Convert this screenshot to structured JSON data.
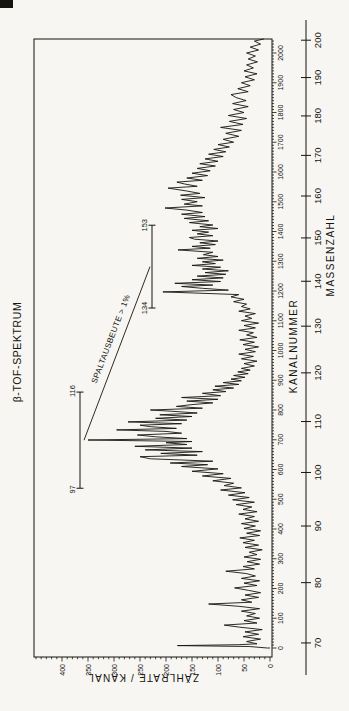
{
  "page": {
    "background": "#f7f6f2",
    "ink_color": "#15140f",
    "scan_artifact": "black mark top-left corner"
  },
  "chart_data": {
    "type": "line",
    "title": "β-TOF-SPEKTRUM",
    "xlabel": "KANALNUMMER",
    "x2label": "MASSENZAHL",
    "ylabel": "ZÄHLRATE / KANAL",
    "orientation": "chart rotated 90deg counterclockwise on page",
    "channel_axis": {
      "min": 0,
      "max": 2047,
      "label_step": 100,
      "minor_step": 10,
      "labels": [
        0,
        100,
        200,
        300,
        400,
        500,
        600,
        700,
        800,
        900,
        1000,
        1100,
        1200,
        1300,
        1400,
        1500,
        1600,
        1700,
        1800,
        1900,
        2000
      ]
    },
    "count_axis": {
      "min": 0,
      "max": 455,
      "label_step": 50,
      "minor_step": 10,
      "labels": [
        0,
        50,
        100,
        150,
        200,
        250,
        300,
        350,
        400
      ]
    },
    "mass_axis": {
      "min": 70,
      "max": 200,
      "tick_step": 10,
      "labels": [
        70,
        80,
        90,
        100,
        110,
        120,
        130,
        140,
        150,
        160,
        170,
        180,
        190,
        200
      ],
      "calibration_channel_from_mass": {
        "a": 350.8,
        "b": -2918
      }
    },
    "annotations": {
      "yield_label": "SPALTAUSBEUTE > 1%",
      "brackets": [
        {
          "mass_from": 97,
          "mass_to": 116,
          "label_low": "97",
          "label_high": "116"
        },
        {
          "mass_from": 134,
          "mass_to": 153,
          "label_low": "134",
          "label_high": "153"
        }
      ]
    },
    "series": [
      {
        "name": "beta-tof-spectrum",
        "points": [
          [
            0,
            5
          ],
          [
            5,
            40
          ],
          [
            8,
            178
          ],
          [
            11,
            60
          ],
          [
            14,
            25
          ],
          [
            22,
            45
          ],
          [
            30,
            18
          ],
          [
            38,
            52
          ],
          [
            46,
            22
          ],
          [
            54,
            48
          ],
          [
            62,
            15
          ],
          [
            70,
            58
          ],
          [
            77,
            88
          ],
          [
            84,
            25
          ],
          [
            92,
            50
          ],
          [
            100,
            20
          ],
          [
            108,
            45
          ],
          [
            116,
            28
          ],
          [
            124,
            55
          ],
          [
            132,
            20
          ],
          [
            140,
            60
          ],
          [
            148,
            118
          ],
          [
            154,
            35
          ],
          [
            162,
            55
          ],
          [
            170,
            22
          ],
          [
            178,
            48
          ],
          [
            186,
            18
          ],
          [
            194,
            42
          ],
          [
            202,
            68
          ],
          [
            210,
            25
          ],
          [
            218,
            50
          ],
          [
            226,
            20
          ],
          [
            234,
            55
          ],
          [
            242,
            28
          ],
          [
            250,
            45
          ],
          [
            258,
            85
          ],
          [
            266,
            30
          ],
          [
            274,
            52
          ],
          [
            282,
            20
          ],
          [
            290,
            44
          ],
          [
            298,
            18
          ],
          [
            306,
            50
          ],
          [
            314,
            25
          ],
          [
            322,
            40
          ],
          [
            330,
            15
          ],
          [
            338,
            48
          ],
          [
            346,
            22
          ],
          [
            354,
            52
          ],
          [
            362,
            30
          ],
          [
            370,
            58
          ],
          [
            378,
            20
          ],
          [
            386,
            45
          ],
          [
            394,
            18
          ],
          [
            402,
            50
          ],
          [
            410,
            28
          ],
          [
            418,
            55
          ],
          [
            426,
            22
          ],
          [
            434,
            48
          ],
          [
            442,
            30
          ],
          [
            450,
            60
          ],
          [
            458,
            25
          ],
          [
            466,
            52
          ],
          [
            474,
            35
          ],
          [
            482,
            65
          ],
          [
            490,
            30
          ],
          [
            498,
            72
          ],
          [
            506,
            40
          ],
          [
            514,
            80
          ],
          [
            522,
            48
          ],
          [
            531,
            95
          ],
          [
            538,
            55
          ],
          [
            546,
            88
          ],
          [
            554,
            70
          ],
          [
            562,
            110
          ],
          [
            570,
            75
          ],
          [
            578,
            130
          ],
          [
            586,
            90
          ],
          [
            594,
            150
          ],
          [
            602,
            100
          ],
          [
            610,
            170
          ],
          [
            616,
            120
          ],
          [
            622,
            192
          ],
          [
            628,
            110
          ],
          [
            636,
            230
          ],
          [
            643,
            250
          ],
          [
            648,
            140
          ],
          [
            654,
            210
          ],
          [
            660,
            130
          ],
          [
            666,
            240
          ],
          [
            672,
            150
          ],
          [
            678,
            260
          ],
          [
            684,
            160
          ],
          [
            690,
            200
          ],
          [
            694,
            150
          ],
          [
            699,
            350
          ],
          [
            704,
            160
          ],
          [
            710,
            220
          ],
          [
            716,
            255
          ],
          [
            722,
            170
          ],
          [
            728,
            200
          ],
          [
            733,
            295
          ],
          [
            738,
            180
          ],
          [
            744,
            230
          ],
          [
            749,
            250
          ],
          [
            754,
            170
          ],
          [
            760,
            273
          ],
          [
            766,
            160
          ],
          [
            772,
            220
          ],
          [
            778,
            150
          ],
          [
            784,
            212
          ],
          [
            790,
            140
          ],
          [
            796,
            190
          ],
          [
            800,
            230
          ],
          [
            806,
            130
          ],
          [
            812,
            180
          ],
          [
            818,
            150
          ],
          [
            824,
            110
          ],
          [
            830,
            160
          ],
          [
            836,
            100
          ],
          [
            842,
            170
          ],
          [
            848,
            95
          ],
          [
            856,
            130
          ],
          [
            862,
            85
          ],
          [
            868,
            110
          ],
          [
            874,
            70
          ],
          [
            880,
            106
          ],
          [
            886,
            60
          ],
          [
            892,
            90
          ],
          [
            898,
            55
          ],
          [
            904,
            75
          ],
          [
            910,
            48
          ],
          [
            916,
            70
          ],
          [
            922,
            42
          ],
          [
            928,
            62
          ],
          [
            934,
            38
          ],
          [
            940,
            55
          ],
          [
            948,
            30
          ],
          [
            956,
            50
          ],
          [
            964,
            25
          ],
          [
            972,
            55
          ],
          [
            980,
            32
          ],
          [
            988,
            60
          ],
          [
            996,
            28
          ],
          [
            1004,
            48
          ],
          [
            1012,
            22
          ],
          [
            1020,
            52
          ],
          [
            1028,
            30
          ],
          [
            1036,
            58
          ],
          [
            1044,
            25
          ],
          [
            1052,
            45
          ],
          [
            1060,
            32
          ],
          [
            1068,
            60
          ],
          [
            1076,
            28
          ],
          [
            1084,
            50
          ],
          [
            1092,
            22
          ],
          [
            1100,
            55
          ],
          [
            1108,
            35
          ],
          [
            1116,
            48
          ],
          [
            1124,
            28
          ],
          [
            1132,
            60
          ],
          [
            1140,
            38
          ],
          [
            1148,
            55
          ],
          [
            1156,
            45
          ],
          [
            1164,
            70
          ],
          [
            1172,
            50
          ],
          [
            1180,
            75
          ],
          [
            1188,
            60
          ],
          [
            1197,
            206
          ],
          [
            1203,
            80
          ],
          [
            1209,
            130
          ],
          [
            1215,
            170
          ],
          [
            1220,
            110
          ],
          [
            1226,
            183
          ],
          [
            1232,
            95
          ],
          [
            1238,
            150
          ],
          [
            1244,
            90
          ],
          [
            1250,
            140
          ],
          [
            1256,
            85
          ],
          [
            1262,
            125
          ],
          [
            1268,
            80
          ],
          [
            1274,
            130
          ],
          [
            1280,
            95
          ],
          [
            1286,
            150
          ],
          [
            1292,
            105
          ],
          [
            1298,
            130
          ],
          [
            1304,
            90
          ],
          [
            1310,
            140
          ],
          [
            1316,
            100
          ],
          [
            1322,
            128
          ],
          [
            1330,
            110
          ],
          [
            1338,
            177
          ],
          [
            1344,
            115
          ],
          [
            1350,
            150
          ],
          [
            1356,
            105
          ],
          [
            1362,
            135
          ],
          [
            1368,
            100
          ],
          [
            1374,
            145
          ],
          [
            1380,
            155
          ],
          [
            1386,
            110
          ],
          [
            1392,
            140
          ],
          [
            1398,
            118
          ],
          [
            1404,
            150
          ],
          [
            1410,
            100
          ],
          [
            1416,
            135
          ],
          [
            1422,
            110
          ],
          [
            1430,
            155
          ],
          [
            1436,
            118
          ],
          [
            1444,
            165
          ],
          [
            1450,
            125
          ],
          [
            1458,
            170
          ],
          [
            1464,
            130
          ],
          [
            1472,
            160
          ],
          [
            1479,
            202
          ],
          [
            1486,
            130
          ],
          [
            1492,
            165
          ],
          [
            1500,
            140
          ],
          [
            1508,
            170
          ],
          [
            1514,
            125
          ],
          [
            1522,
            172
          ],
          [
            1528,
            135
          ],
          [
            1536,
            160
          ],
          [
            1546,
            196
          ],
          [
            1552,
            140
          ],
          [
            1560,
            165
          ],
          [
            1566,
            179
          ],
          [
            1572,
            130
          ],
          [
            1580,
            160
          ],
          [
            1588,
            120
          ],
          [
            1596,
            150
          ],
          [
            1604,
            115
          ],
          [
            1612,
            140
          ],
          [
            1620,
            105
          ],
          [
            1628,
            135
          ],
          [
            1636,
            100
          ],
          [
            1644,
            125
          ],
          [
            1652,
            90
          ],
          [
            1660,
            118
          ],
          [
            1668,
            85
          ],
          [
            1676,
            108
          ],
          [
            1684,
            78
          ],
          [
            1692,
            100
          ],
          [
            1700,
            70
          ],
          [
            1710,
            90
          ],
          [
            1720,
            60
          ],
          [
            1730,
            85
          ],
          [
            1740,
            55
          ],
          [
            1750,
            95
          ],
          [
            1760,
            52
          ],
          [
            1770,
            78
          ],
          [
            1780,
            45
          ],
          [
            1790,
            80
          ],
          [
            1800,
            50
          ],
          [
            1810,
            70
          ],
          [
            1820,
            42
          ],
          [
            1830,
            72
          ],
          [
            1840,
            46
          ],
          [
            1850,
            65
          ],
          [
            1860,
            75
          ],
          [
            1870,
            42
          ],
          [
            1880,
            62
          ],
          [
            1890,
            38
          ],
          [
            1900,
            55
          ],
          [
            1910,
            30
          ],
          [
            1920,
            48
          ],
          [
            1930,
            25
          ],
          [
            1940,
            50
          ],
          [
            1950,
            32
          ],
          [
            1960,
            45
          ],
          [
            1970,
            24
          ],
          [
            1980,
            42
          ],
          [
            1990,
            28
          ],
          [
            2000,
            45
          ],
          [
            2010,
            22
          ],
          [
            2020,
            38
          ],
          [
            2030,
            18
          ],
          [
            2040,
            30
          ],
          [
            2047,
            12
          ]
        ]
      }
    ]
  }
}
